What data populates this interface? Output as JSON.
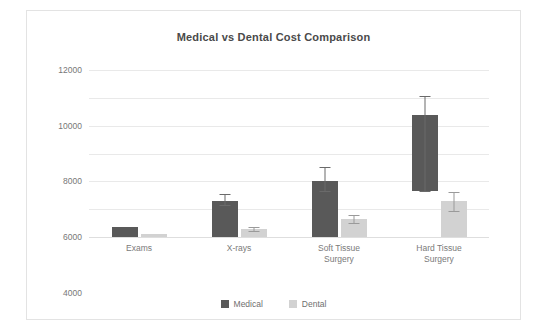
{
  "card": {
    "name": "chart-card"
  },
  "chart_data": {
    "type": "bar",
    "title": "Medical vs Dental Cost Comparison",
    "xlabel": "",
    "ylabel": "",
    "ylim": [
      0,
      12000
    ],
    "yticks": [
      0,
      2000,
      4000,
      6000,
      8000,
      10000,
      12000
    ],
    "ytick_labels": [
      "0",
      "2000",
      "4000",
      "6000",
      "8000",
      "10000",
      "12000"
    ],
    "grid": true,
    "legend_position": "bottom",
    "categories": [
      "Exams",
      "X-rays",
      "Soft Tissue Surgery",
      "Hard Tissue Surgery"
    ],
    "category_lines": [
      [
        "Exams"
      ],
      [
        "X-rays"
      ],
      [
        "Soft Tissue",
        "Surgery"
      ],
      [
        "Hard Tissue",
        "Surgery"
      ]
    ],
    "series": [
      {
        "name": "Medical",
        "color": "#595959",
        "values": [
          700,
          2600,
          4000,
          8800
        ],
        "bar_base": [
          0,
          0,
          0,
          3300
        ],
        "err_low": [
          700,
          2300,
          3300,
          3300
        ],
        "err_high": [
          700,
          3100,
          5000,
          10100
        ]
      },
      {
        "name": "Dental",
        "color": "#d2d2d2",
        "values": [
          250,
          600,
          1300,
          2600
        ],
        "bar_base": [
          0,
          0,
          0,
          0
        ],
        "err_low": [
          250,
          450,
          1000,
          1900
        ],
        "err_high": [
          250,
          750,
          1600,
          3200
        ]
      }
    ]
  },
  "legend": {
    "items": [
      {
        "label": "Medical",
        "color": "#595959"
      },
      {
        "label": "Dental",
        "color": "#d2d2d2"
      }
    ]
  }
}
